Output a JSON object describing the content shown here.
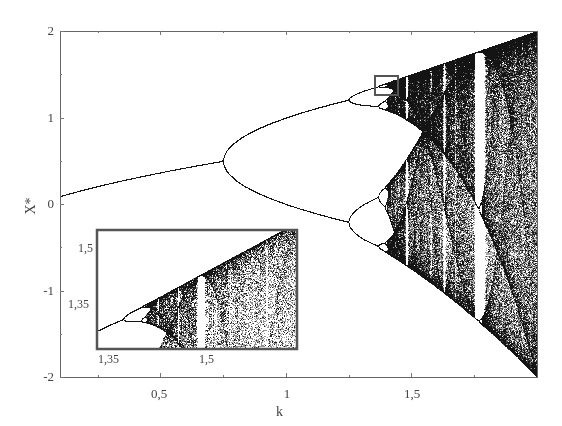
{
  "chart_data": {
    "type": "scatter",
    "title": "",
    "xlabel": "k",
    "ylabel": "X*",
    "xlim": [
      0.1,
      2.0
    ],
    "ylim": [
      -2,
      2
    ],
    "grid": false,
    "legend": null,
    "x_ticks": [
      {
        "value": 0.5,
        "label": "0,5"
      },
      {
        "value": 1,
        "label": "1"
      },
      {
        "value": 1.5,
        "label": "1,5"
      }
    ],
    "x_minor_ticks": [
      0.25,
      0.75,
      1.25,
      1.75
    ],
    "y_ticks": [
      {
        "value": 2,
        "label": "2"
      },
      {
        "value": 1,
        "label": "1"
      },
      {
        "value": 0,
        "label": "0"
      },
      {
        "value": -1,
        "label": "-1"
      },
      {
        "value": -2,
        "label": "-2"
      }
    ],
    "y_minor_ticks": [
      1.5,
      0.5,
      -0.5,
      -1.5
    ],
    "features": {
      "first_bifurcation_k": 0.75,
      "second_bifurcation_k": 1.25,
      "chaos_onset_k": 1.401,
      "period3_window_k": [
        1.75,
        1.79
      ]
    },
    "highlight_box": {
      "k_range": [
        1.35,
        1.44
      ],
      "x_range": [
        1.28,
        1.5
      ]
    },
    "inset": {
      "xlim": [
        1.33,
        1.62
      ],
      "ylim": [
        1.28,
        1.6
      ],
      "x_ticks": [
        {
          "value": 1.35,
          "label": "1,35"
        },
        {
          "value": 1.5,
          "label": "1,5"
        }
      ],
      "y_ticks": [
        {
          "value": 1.5,
          "label": "1,5"
        },
        {
          "value": 1.35,
          "label": "1,35"
        }
      ]
    }
  },
  "labels": {
    "xlabel": "k",
    "ylabel": "X*",
    "y_ticks": [
      "2",
      "1",
      "0",
      "-1",
      "-2"
    ],
    "x_ticks": [
      "0,5",
      "1",
      "1,5"
    ],
    "inset_x_ticks": [
      "1,35",
      "1,5"
    ],
    "inset_y_ticks": [
      "1,5",
      "1,35"
    ]
  },
  "colors": {
    "points": "#1a1a1a",
    "frame": "#666666",
    "highlight_box": "#555555"
  }
}
